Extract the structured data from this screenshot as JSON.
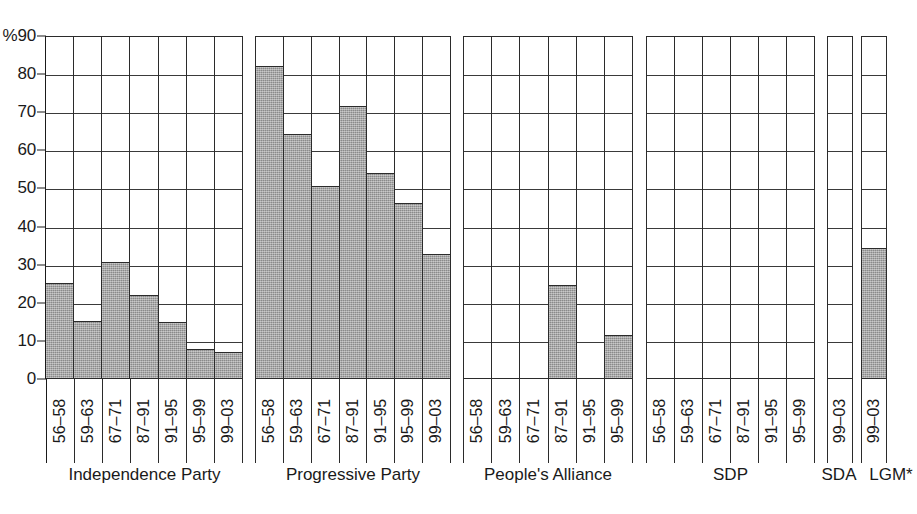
{
  "chart_data": {
    "type": "bar",
    "title": "",
    "subtitle": "",
    "xlabel": "",
    "ylabel": "%",
    "ylim": [
      0,
      90
    ],
    "ytick_values": [
      0,
      10,
      20,
      30,
      40,
      50,
      60,
      70,
      80,
      90
    ],
    "ytick_labels": [
      "0",
      "10",
      "20",
      "30",
      "40",
      "50",
      "60",
      "70",
      "80",
      "90"
    ],
    "y_axis_unit_label": "%",
    "y_top_label": "%90",
    "grid": true,
    "legend": "none",
    "orientation": "vertical",
    "panel_layout": "small-multiples",
    "bar_color": "#9a9a9a",
    "bar_edge_color": "#2b2b2b",
    "axis_color": "#1a1a1a",
    "background_color": "#ffffff",
    "panels": [
      {
        "name": "Independence Party",
        "categories": [
          "56–58",
          "59–63",
          "67–71",
          "87–91",
          "91–95",
          "95–99",
          "99–03"
        ],
        "values": [
          25.0,
          15.0,
          30.5,
          21.8,
          14.8,
          7.6,
          6.9
        ]
      },
      {
        "name": "Progressive Party",
        "categories": [
          "56–58",
          "59–63",
          "67–71",
          "87–91",
          "91–95",
          "95–99",
          "99–03"
        ],
        "values": [
          81.8,
          64.0,
          50.4,
          71.3,
          53.8,
          46.0,
          32.5
        ]
      },
      {
        "name": "People's Alliance",
        "categories": [
          "56–58",
          "59–63",
          "67–71",
          "87–91",
          "91–95",
          "95–99"
        ],
        "values": [
          0,
          0,
          0,
          24.5,
          0,
          11.3
        ]
      },
      {
        "name": "SDP",
        "categories": [
          "56–58",
          "59–63",
          "67–71",
          "87–91",
          "91–95",
          "95–99"
        ],
        "values": [
          0,
          0,
          0,
          0,
          0,
          0
        ]
      },
      {
        "name": "SDA",
        "categories": [
          "99–03"
        ],
        "values": [
          0
        ]
      },
      {
        "name": "LGM*",
        "categories": [
          "99–03"
        ],
        "values": [
          34.0
        ]
      }
    ]
  },
  "y_axis": {
    "ticks": [
      {
        "label": "%90",
        "value": 90
      },
      {
        "label": "80",
        "value": 80
      },
      {
        "label": "70",
        "value": 70
      },
      {
        "label": "60",
        "value": 60
      },
      {
        "label": "50",
        "value": 50
      },
      {
        "label": "40",
        "value": 40
      },
      {
        "label": "30",
        "value": 30
      },
      {
        "label": "20",
        "value": 20
      },
      {
        "label": "10",
        "value": 10
      },
      {
        "label": "0",
        "value": 0
      }
    ]
  }
}
